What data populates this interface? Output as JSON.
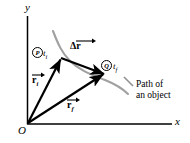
{
  "figure": {
    "background_color": "#ffffff",
    "axes": {
      "x_label": "x",
      "y_label": "y",
      "origin_label": "O",
      "axis_color": "#000000"
    },
    "path": {
      "label_line1": "Path of",
      "label_line2": "an object",
      "color": "#999999"
    },
    "points": [
      {
        "marker": "P",
        "time_symbol": "t",
        "time_subscript": "i"
      },
      {
        "marker": "Q",
        "time_symbol": "t",
        "time_subscript": "f"
      }
    ],
    "vectors": [
      {
        "symbol": "r",
        "subscript": "i",
        "name": "initial-position-vector",
        "color": "#000000"
      },
      {
        "symbol": "r",
        "subscript": "f",
        "name": "final-position-vector",
        "color": "#000000"
      },
      {
        "symbol": "Δr",
        "subscript": "",
        "name": "displacement-vector",
        "color": "#000000"
      }
    ]
  }
}
